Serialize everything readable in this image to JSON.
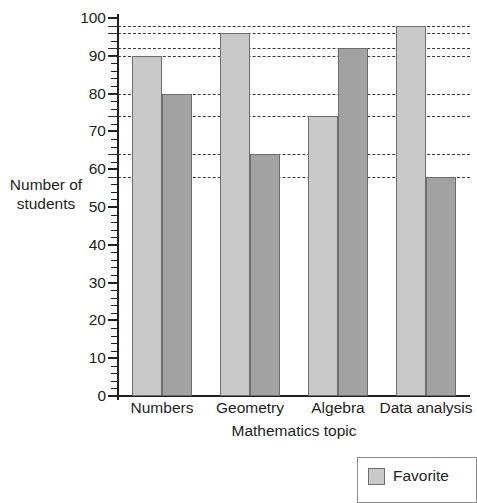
{
  "chart_data": {
    "type": "bar",
    "title": "",
    "subtitle": "",
    "xlabel": "Mathematics topic",
    "ylabel": "Number of students",
    "ylabel_line1": "Number of",
    "ylabel_line2": "students",
    "categories": [
      "Numbers",
      "Geometry",
      "Algebra",
      "Data analysis"
    ],
    "series": [
      {
        "name": "Favorite",
        "values": [
          90,
          96,
          74,
          98
        ],
        "color": "#c9c9c9"
      },
      {
        "name": "Least favorite",
        "values": [
          80,
          64,
          92,
          58
        ],
        "color": "#a2a2a2"
      }
    ],
    "ylim": [
      0,
      100
    ],
    "ytick_major_step": 10,
    "ytick_minor_step": 2,
    "ytick_labels": [
      "0",
      "10",
      "20",
      "30",
      "40",
      "50",
      "60",
      "70",
      "80",
      "90",
      "100"
    ],
    "grid": false,
    "reference_lines": [
      98,
      96,
      92,
      90,
      80,
      74,
      64,
      58
    ],
    "reference_line_style": "dashed",
    "legend_position": "bottom-right",
    "legend_visible_entries": [
      "Favorite"
    ],
    "bar_orientation": "vertical",
    "bar_grouping": "clustered"
  },
  "legend": {
    "entries": [
      {
        "label": "Favorite",
        "swatch": "favorite-swatch"
      }
    ]
  },
  "icons": {
    "legend_swatch": "square-swatch-icon"
  }
}
